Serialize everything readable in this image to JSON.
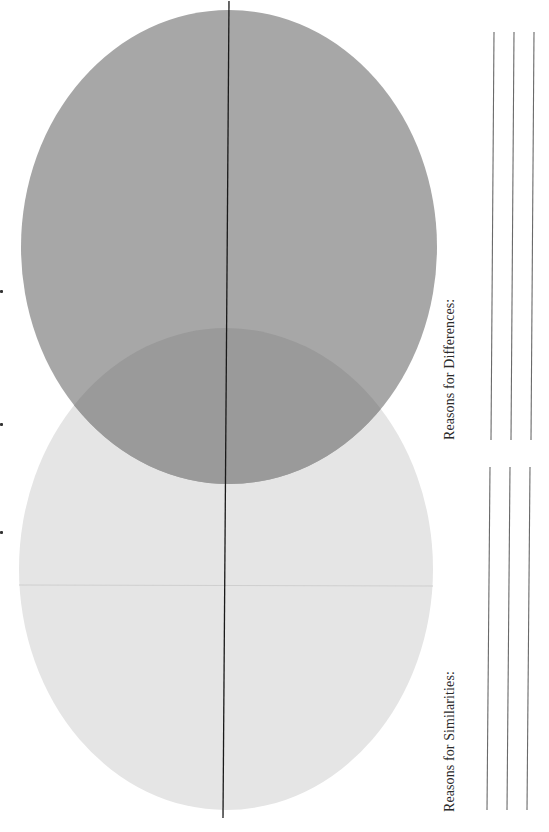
{
  "worksheet": {
    "type": "venn-diagram-worksheet",
    "orientation": "rotated-90-ccw",
    "venn": {
      "circles": [
        {
          "id": "top",
          "label": "",
          "fill": "#a7a7a7",
          "cx": 229,
          "cy": 247,
          "rx": 208,
          "ry": 237
        },
        {
          "id": "bottom",
          "label": "",
          "fill": "#e5e5e5",
          "cx": 226,
          "cy": 569,
          "rx": 207,
          "ry": 241
        }
      ],
      "overlap_fill": "#9a9a9a",
      "center_axis": {
        "x1": 229,
        "y1": 1,
        "x2": 223,
        "y2": 818,
        "color": "#1a1a1a"
      }
    },
    "sections": [
      {
        "id": "reasons-differences",
        "heading": "Reasons for Differences:",
        "answer_lines": 3
      },
      {
        "id": "reasons-similarities",
        "heading": "Reasons for Similarities:",
        "answer_lines": 3
      }
    ]
  }
}
